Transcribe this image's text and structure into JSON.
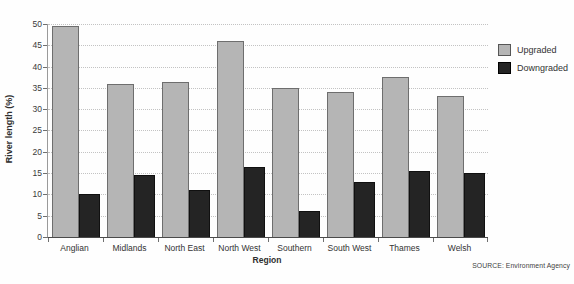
{
  "chart_data": {
    "type": "bar",
    "title": "",
    "categories": [
      "Anglian",
      "Midlands",
      "North East",
      "North West",
      "Southern",
      "South West",
      "Thames",
      "Welsh"
    ],
    "series": [
      {
        "name": "Upgraded",
        "color": "#b5b5b5",
        "border": "#6e6e6e",
        "values": [
          49.5,
          36,
          36.5,
          46,
          35,
          34,
          37.5,
          33
        ]
      },
      {
        "name": "Downgraded",
        "color": "#242424",
        "border": "#101010",
        "values": [
          10,
          14.5,
          11,
          16.5,
          6,
          13,
          15.5,
          15
        ]
      }
    ],
    "xlabel": "Region",
    "ylabel": "River length (%)",
    "ylim": [
      0,
      50
    ],
    "ytick_step": 5,
    "grid": "horizontal-dotted",
    "legend_position": "right"
  },
  "source_note": "SOURCE: Environment Agency",
  "colors": {
    "background": "#fefefe",
    "axis": "#4a4a4a",
    "gridline": "#c3c3c3",
    "text": "#3a3a3a",
    "upgraded": "#b5b5b5",
    "downgraded": "#242424"
  }
}
